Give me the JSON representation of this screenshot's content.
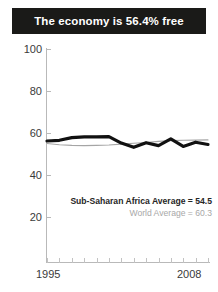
{
  "title": {
    "text": "The economy is 56.4% free"
  },
  "legend": {
    "primary": "Sub-Saharan Africa Average = 54.5",
    "secondary": "World Average = 60.3"
  },
  "axis": {
    "y_ticks": [
      "100",
      "80",
      "60",
      "40",
      "20"
    ],
    "x_start": "1995",
    "x_end": "2008"
  },
  "colors": {
    "banner_bg": "#1a1a18",
    "banner_text": "#ffffff",
    "primary_series": "#111111",
    "secondary_series": "#a5a5a5",
    "axis": "#b9b9b9",
    "tick_text": "#3a3a3a"
  },
  "chart_data": {
    "type": "line",
    "title": "The economy is 56.4% free",
    "xlabel": "",
    "ylabel": "",
    "x": [
      1995,
      1996,
      1997,
      1998,
      1999,
      2000,
      2001,
      2002,
      2003,
      2004,
      2005,
      2006,
      2007,
      2008
    ],
    "xlim": [
      1995,
      2008
    ],
    "ylim": [
      0,
      100
    ],
    "yticks": [
      20,
      40,
      60,
      80,
      100
    ],
    "grid": false,
    "legend_position": "inside-lower-right",
    "series": [
      {
        "name": "Sub-Saharan Africa Average",
        "label": "Sub-Saharan Africa Average = 54.5",
        "color": "#111111",
        "width": "thick",
        "final_value": 54.5,
        "values": [
          56.2,
          56.5,
          57.8,
          58.2,
          58.2,
          58.3,
          55.2,
          53.2,
          55.4,
          54.0,
          57.2,
          53.6,
          55.6,
          54.5
        ]
      },
      {
        "name": "World Average",
        "label": "World Average = 60.3",
        "color": "#a5a5a5",
        "width": "thin",
        "final_value": 60.3,
        "values": [
          55.0,
          54.4,
          54.1,
          54.0,
          54.1,
          54.3,
          54.7,
          55.1,
          55.5,
          56.0,
          56.4,
          56.5,
          56.6,
          56.7
        ]
      }
    ],
    "annotations": [
      {
        "text": "The economy is 56.4% free",
        "position": "banner-top"
      }
    ]
  }
}
